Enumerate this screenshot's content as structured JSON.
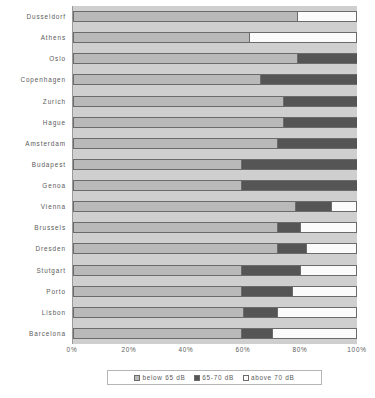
{
  "chart_data": {
    "type": "bar",
    "orientation": "horizontal",
    "stacked": true,
    "stack_mode": "percent",
    "title": "",
    "subtitle": "",
    "xlabel": "",
    "ylabel": "",
    "xlim": [
      0,
      100
    ],
    "xticks": [
      0,
      20,
      40,
      60,
      80,
      100
    ],
    "xtick_labels": [
      "0%",
      "20%",
      "40%",
      "60%",
      "80%",
      "100%"
    ],
    "grid": false,
    "legend_position": "bottom",
    "categories": [
      "Dusseldorf",
      "Athens",
      "Oslo",
      "Copenhagen",
      "Zurich",
      "Hague",
      "Amsterdam",
      "Budapest",
      "Genoa",
      "Vienna",
      "Brussels",
      "Dresden",
      "Stutgart",
      "Porto",
      "Lisbon",
      "Barcelona"
    ],
    "series": [
      {
        "name": "below 65 dB",
        "color": "#b9b9b9",
        "values": [
          79,
          62,
          79,
          66,
          74,
          74,
          72,
          59,
          59,
          78,
          72,
          72,
          59,
          59,
          60,
          59
        ]
      },
      {
        "name": "65-70 dB",
        "color": "#555555",
        "values": [
          0,
          0,
          21,
          34,
          26,
          26,
          28,
          41,
          41,
          13,
          8,
          10,
          21,
          18,
          12,
          11
        ]
      },
      {
        "name": "above 70 dB",
        "color": "#fbfbfb",
        "values": [
          21,
          38,
          0,
          0,
          0,
          0,
          0,
          0,
          0,
          9,
          20,
          18,
          20,
          23,
          28,
          30
        ]
      }
    ]
  }
}
